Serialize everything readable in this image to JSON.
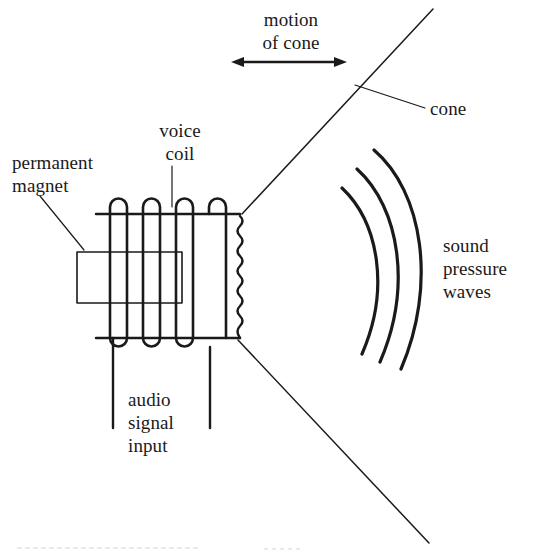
{
  "figure": {
    "background_color": "#ffffff",
    "ink_color": "#1a1a1a"
  },
  "labels": {
    "motion_of_cone": "motion\nof cone",
    "cone": "cone",
    "voice_coil": "voice\ncoil",
    "permanent_magnet": "permanent\nmagnet",
    "sound_pressure_waves": "sound\npressure\nwaves",
    "audio_signal_input": "audio\nsignal\ninput"
  },
  "parts": {
    "voice_coil": {
      "name": "voice coil",
      "top_loops": 4,
      "bottom_loops": 3,
      "top_rail_y": 214,
      "bottom_rail_y": 338
    },
    "permanent_magnet": {
      "name": "permanent magnet",
      "shape": "rectangle"
    },
    "cone": {
      "name": "cone",
      "shape": "two diverging straight lines"
    },
    "surround": {
      "name": "corrugated surround",
      "shape": "vertical zigzag"
    },
    "sound_waves": {
      "name": "sound pressure waves",
      "arc_count": 3
    },
    "terminals": {
      "name": "audio signal input leads",
      "lead_count": 2
    }
  }
}
